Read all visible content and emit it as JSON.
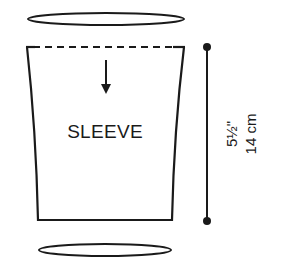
{
  "diagram": {
    "type": "knitting-schematic",
    "piece": {
      "label": "SLEEVE"
    },
    "dimension": {
      "imperial": "5½\"",
      "metric": "14 cm"
    },
    "colors": {
      "stroke": "#1a1a1a",
      "background": "#ffffff"
    }
  }
}
